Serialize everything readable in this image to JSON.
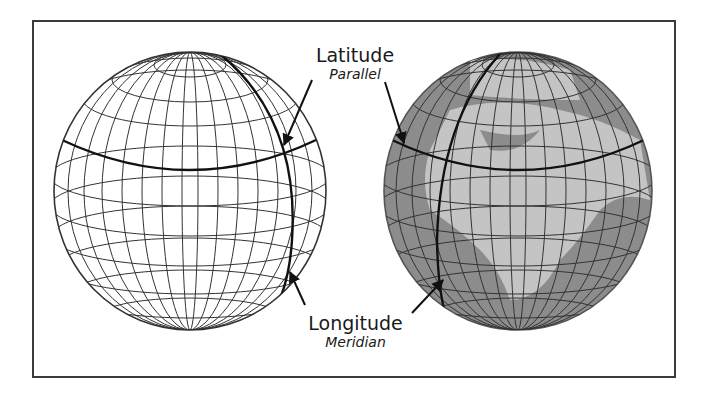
{
  "figure": {
    "latitude": {
      "term": "Latitude",
      "synonym": "Parallel"
    },
    "longitude": {
      "term": "Longitude",
      "synonym": "Meridian"
    },
    "globes": [
      {
        "id": "wireframe-globe",
        "fill": "#ffffff",
        "style": "wireframe"
      },
      {
        "id": "earth-globe",
        "fill": "#8c8c8c",
        "land_color": "#c4c4c4",
        "style": "shaded-with-continents"
      }
    ],
    "colors": {
      "grid": "#333333",
      "frame": "#3a3a3a",
      "text": "#1a1a1a",
      "highlight_line": "#111111"
    }
  }
}
